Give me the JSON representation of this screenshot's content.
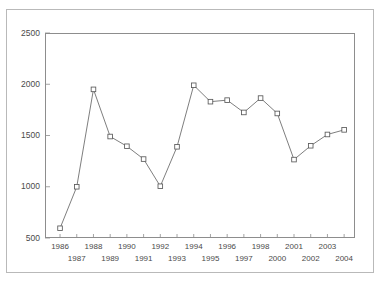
{
  "figure": {
    "title_partial": "",
    "background": "#ffffff",
    "frame_color": "#b9b9b9",
    "axis_color": "#8d8d8d",
    "line_color": "#6f6f6f",
    "marker_fill": "#ffffff",
    "marker_stroke": "#5a5a5a",
    "tick_label_color": "#4a4a4a"
  },
  "chart_data": {
    "type": "line",
    "title": "",
    "subtitle": "",
    "xlabel": "",
    "ylabel": "",
    "grid": false,
    "legend": null,
    "legend_position": "none",
    "ylim": [
      500,
      2500
    ],
    "ytick_labels": [
      "500",
      "1000",
      "1500",
      "2000",
      "2500"
    ],
    "yticks": [
      500,
      1000,
      1500,
      2000,
      2500
    ],
    "categories": [
      "1986",
      "1987",
      "1988",
      "1989",
      "1990",
      "1991",
      "1992",
      "1993",
      "1994",
      "1995",
      "1996",
      "1997",
      "1998",
      "2000",
      "2001",
      "2002",
      "2003",
      "2004"
    ],
    "xtick_labels_row1": [
      "1986",
      "",
      "1988",
      "",
      "1990",
      "",
      "1992",
      "",
      "1994",
      "",
      "1996",
      "",
      "1998",
      "",
      "2001",
      "",
      "2003",
      ""
    ],
    "xtick_labels_row2": [
      "",
      "1987",
      "",
      "1989",
      "",
      "1991",
      "",
      "1993",
      "",
      "1995",
      "",
      "1997",
      "",
      "2000",
      "",
      "2002",
      "",
      "2004"
    ],
    "values": [
      595,
      1000,
      1950,
      1490,
      1395,
      1270,
      1005,
      1390,
      1990,
      1830,
      1845,
      1725,
      1865,
      1715,
      1265,
      1400,
      1510,
      1555
    ],
    "marker": "square",
    "series": [
      {
        "name": "series-1",
        "values": [
          595,
          1000,
          1950,
          1490,
          1395,
          1270,
          1005,
          1390,
          1990,
          1830,
          1845,
          1725,
          1865,
          1715,
          1265,
          1400,
          1510,
          1555
        ]
      }
    ]
  }
}
